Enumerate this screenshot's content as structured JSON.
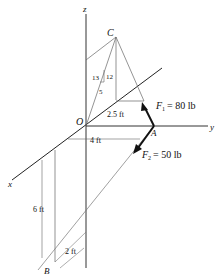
{
  "diagram": {
    "axes": {
      "x": "x",
      "y": "y",
      "z": "z"
    },
    "points": {
      "origin": "O",
      "a": "A",
      "b": "B",
      "c": "C"
    },
    "forces": [
      {
        "symbol": "F",
        "sub": "1",
        "value": "= 80 lb"
      },
      {
        "symbol": "F",
        "sub": "2",
        "value": "= 50 lb"
      }
    ],
    "slope": {
      "hyp": "13",
      "rise": "12",
      "run": "5"
    },
    "dimensions": {
      "d1": "2.5 ft",
      "d2": "4 ft",
      "d3": "6 ft",
      "d4": "2 ft"
    },
    "colors": {
      "line": "#111111",
      "thin": "#555555"
    }
  }
}
